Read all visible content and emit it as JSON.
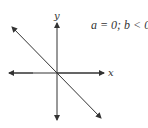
{
  "diagram": {
    "condition": "a = 0; b < 0",
    "axes": {
      "x_label": "x",
      "y_label": "y"
    },
    "line": {
      "description": "line through origin with negative slope"
    },
    "colors": {
      "stroke": "#333333",
      "background": "#ffffff"
    }
  }
}
